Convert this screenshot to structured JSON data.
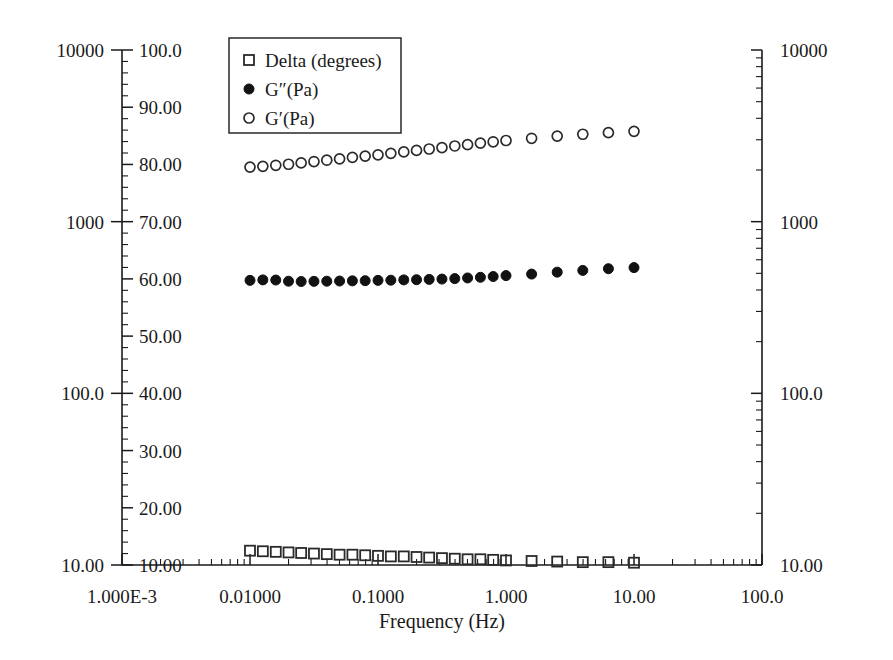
{
  "chart_data": {
    "type": "scatter",
    "title": "",
    "xlabel": "Frequency (Hz)",
    "ylabel": "",
    "xscale": "log",
    "xlim": [
      0.001,
      100
    ],
    "x_tick_labels": [
      "1.000E-3",
      "0.01000",
      "0.1000",
      "1.000",
      "10.00",
      "100.0"
    ],
    "x_tick_values": [
      0.001,
      0.01,
      0.1,
      1,
      10,
      100
    ],
    "left_outer_axis": {
      "scale": "log",
      "tick_labels": [
        "10000",
        "1000",
        "100.0",
        "10.00"
      ],
      "tick_values": [
        10000,
        1000,
        100,
        10
      ],
      "ylim": [
        10,
        10000
      ]
    },
    "left_inner_axis": {
      "scale": "linear",
      "label": "",
      "tick_labels": [
        "100.0",
        "90.00",
        "80.00",
        "70.00",
        "60.00",
        "50.00",
        "40.00",
        "30.00",
        "20.00",
        "10.00"
      ],
      "tick_values": [
        100,
        90,
        80,
        70,
        60,
        50,
        40,
        30,
        20,
        10
      ],
      "ylim": [
        10,
        100
      ]
    },
    "right_axis": {
      "scale": "log",
      "tick_labels": [
        "10000",
        "1000",
        "100.0",
        "10.00"
      ],
      "tick_values": [
        10000,
        1000,
        100,
        10
      ],
      "ylim": [
        10,
        10000
      ]
    },
    "grid": false,
    "legend_position": "upper-left-inside",
    "series": [
      {
        "name": "Delta (degrees)",
        "marker": "open-square",
        "axis": "left_inner_linear",
        "x": [
          0.01,
          0.0126,
          0.0159,
          0.02,
          0.0251,
          0.0316,
          0.0398,
          0.0501,
          0.0631,
          0.0794,
          0.1,
          0.126,
          0.159,
          0.2,
          0.251,
          0.316,
          0.398,
          0.501,
          0.631,
          0.794,
          1.0,
          1.585,
          2.512,
          3.981,
          6.31,
          10.0
        ],
        "values": [
          12.5,
          12.4,
          12.3,
          12.2,
          12.1,
          12.0,
          11.9,
          11.8,
          11.8,
          11.7,
          11.6,
          11.5,
          11.5,
          11.4,
          11.3,
          11.2,
          11.1,
          11.0,
          11.0,
          10.9,
          10.8,
          10.7,
          10.6,
          10.5,
          10.5,
          10.4
        ]
      },
      {
        "name": "G″(Pa)",
        "marker": "filled-circle",
        "axis": "right_log",
        "x": [
          0.01,
          0.0126,
          0.0159,
          0.02,
          0.0251,
          0.0316,
          0.0398,
          0.0501,
          0.0631,
          0.0794,
          0.1,
          0.126,
          0.159,
          0.2,
          0.251,
          0.316,
          0.398,
          0.501,
          0.631,
          0.794,
          1.0,
          1.585,
          2.512,
          3.981,
          6.31,
          10.0
        ],
        "values": [
          455,
          458,
          457,
          450,
          448,
          449,
          450,
          451,
          452,
          453,
          455,
          456,
          458,
          459,
          461,
          463,
          466,
          470,
          474,
          479,
          485,
          495,
          508,
          520,
          532,
          540
        ]
      },
      {
        "name": "G′(Pa)",
        "marker": "open-circle",
        "axis": "right_log",
        "x": [
          0.01,
          0.0126,
          0.0159,
          0.02,
          0.0251,
          0.0316,
          0.0398,
          0.0501,
          0.0631,
          0.0794,
          0.1,
          0.126,
          0.159,
          0.2,
          0.251,
          0.316,
          0.398,
          0.501,
          0.631,
          0.794,
          1.0,
          1.585,
          2.512,
          3.981,
          6.31,
          10.0
        ],
        "values": [
          2080,
          2100,
          2130,
          2160,
          2200,
          2240,
          2280,
          2320,
          2370,
          2410,
          2450,
          2500,
          2550,
          2600,
          2650,
          2700,
          2760,
          2810,
          2870,
          2920,
          2970,
          3060,
          3150,
          3230,
          3300,
          3360
        ]
      }
    ]
  },
  "legend": {
    "items": [
      {
        "label": "Delta (degrees)",
        "marker": "open-square"
      },
      {
        "label": "G″(Pa)",
        "marker": "filled-circle"
      },
      {
        "label": "G′(Pa)",
        "marker": "open-circle"
      }
    ]
  },
  "axes": {
    "x_title": "Frequency (Hz)"
  },
  "colors": {
    "foreground": "#1a1a1a",
    "marker_open": "#2a2a2a",
    "marker_filled": "#121212",
    "background": "#ffffff"
  }
}
